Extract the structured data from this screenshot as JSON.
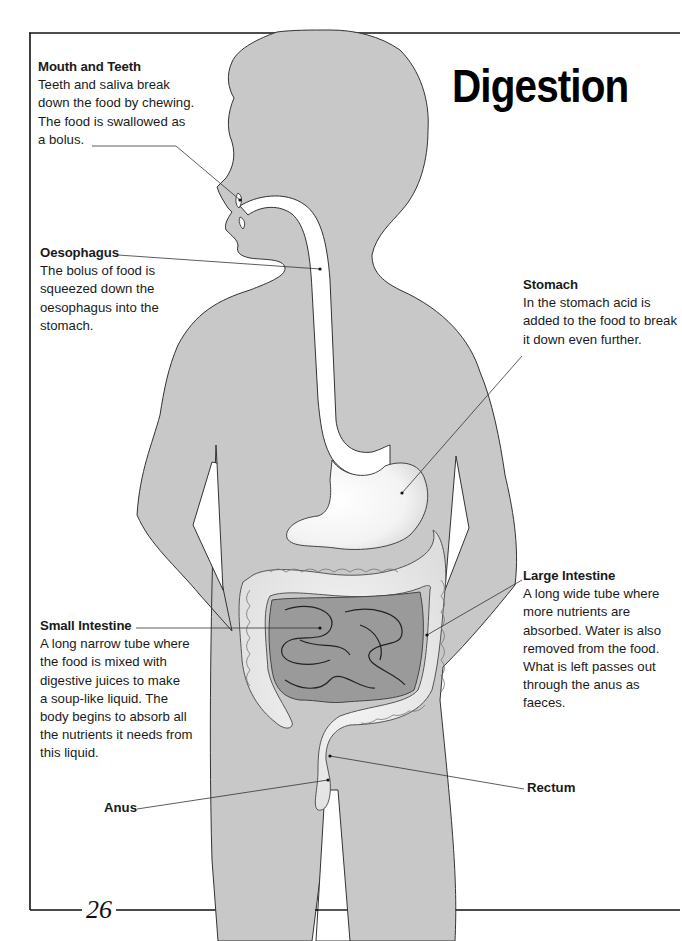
{
  "page": {
    "title": "Digestion",
    "page_number": "26"
  },
  "colors": {
    "silhouette": "#c8c8c8",
    "organ_fill": "#f4f4f4",
    "small_intestine": "#9a9a9a",
    "text": "#1a1a1a"
  },
  "labels": {
    "mouth": {
      "heading": "Mouth and Teeth",
      "body": "Teeth and saliva break\ndown the food by chewing.\nThe food is swallowed as\na bolus."
    },
    "oesophagus": {
      "heading": "Oesophagus",
      "body": "The bolus of food is\nsqueezed down the\noesophagus into the\nstomach."
    },
    "stomach": {
      "heading": "Stomach",
      "body": "In the stomach acid is\nadded to the food to break\nit down even further."
    },
    "large_intestine": {
      "heading": "Large Intestine",
      "body": "A long wide tube where\nmore nutrients are\nabsorbed. Water is also\nremoved from the food.\nWhat is left passes out\nthrough the anus as\nfaeces."
    },
    "small_intestine": {
      "heading": "Small Intestine",
      "body": "A long narrow tube where\nthe food is mixed with\ndigestive juices to make\na soup-like liquid. The\nbody begins to absorb all\nthe nutrients it needs from\nthis liquid."
    },
    "rectum": {
      "heading": "Rectum"
    },
    "anus": {
      "heading": "Anus"
    }
  }
}
